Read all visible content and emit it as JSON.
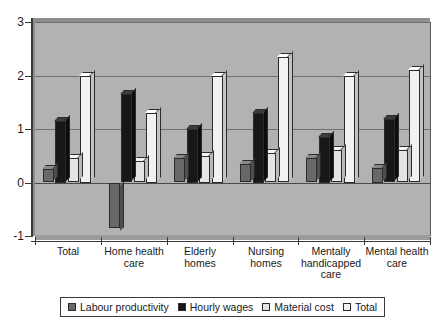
{
  "chart_data": {
    "type": "bar",
    "title": "",
    "subtitle": "",
    "xlabel": "",
    "ylabel": "",
    "categories": [
      "Total",
      "Home health care",
      "Elderly homes",
      "Nursing homes",
      "Mentally handicapped care",
      "Mental health care"
    ],
    "series": [
      {
        "name": "Labour productivity",
        "color": "#686868",
        "values": [
          0.25,
          -0.85,
          0.45,
          0.35,
          0.45,
          0.28
        ]
      },
      {
        "name": "Hourly wages",
        "color": "#171717",
        "values": [
          1.15,
          1.65,
          1.0,
          1.3,
          0.85,
          1.18
        ]
      },
      {
        "name": "Material cost",
        "color": "#e4e4e4",
        "values": [
          0.45,
          0.4,
          0.5,
          0.55,
          0.6,
          0.6
        ]
      },
      {
        "name": "Total",
        "color": "#f2f2f2",
        "values": [
          2.0,
          1.3,
          2.0,
          2.35,
          2.0,
          2.1
        ]
      }
    ],
    "ylim": [
      -1,
      3
    ],
    "yticks": [
      3,
      2,
      1,
      0,
      -1
    ],
    "ytick_labels": [
      "3",
      "2",
      "1",
      "0",
      "-1"
    ],
    "grid": true,
    "gridlines_at": [
      3,
      2,
      1,
      0
    ],
    "legend_position": "bottom",
    "plot_background": "#b2b2b2",
    "legend_entries": [
      "Labour productivity",
      "Hourly wages",
      "Material cost",
      "Total"
    ]
  }
}
